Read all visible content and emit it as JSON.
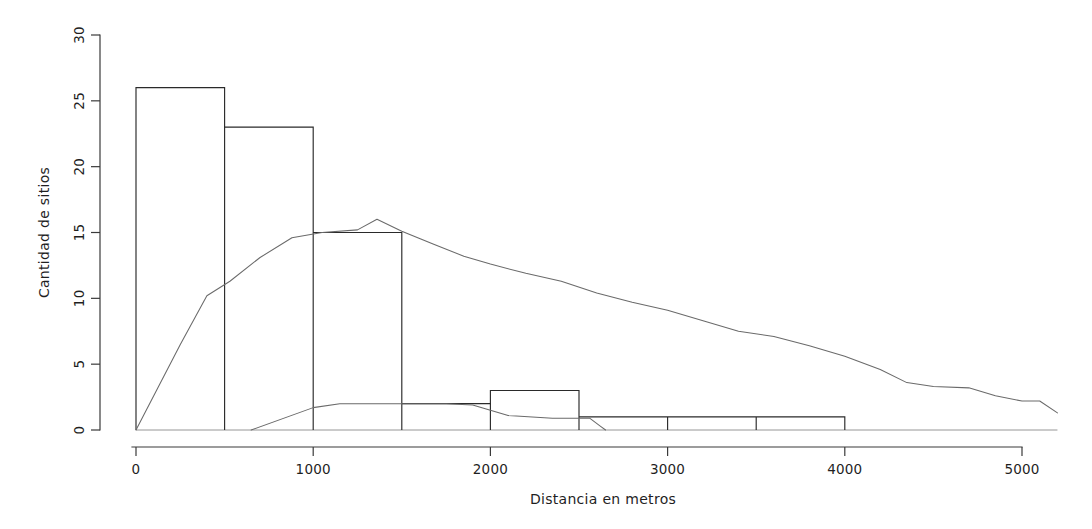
{
  "chart_data": {
    "type": "bar",
    "title": "",
    "subtitle": "",
    "xlabel": "Distancia en metros",
    "ylabel": "Cantidad de sitios",
    "xlim": [
      0,
      5200
    ],
    "ylim": [
      0,
      30
    ],
    "grid": false,
    "legend": "none",
    "xticks": [
      0,
      1000,
      2000,
      3000,
      4000,
      5000
    ],
    "xtick_labels": [
      "0",
      "1000",
      "2000",
      "3000",
      "4000",
      "5000"
    ],
    "yticks": [
      0,
      5,
      10,
      15,
      20,
      25,
      30
    ],
    "ytick_labels": [
      "0",
      "5",
      "10",
      "15",
      "20",
      "25",
      "30"
    ],
    "bin_width": 500,
    "bin_edges": [
      0,
      500,
      1000,
      1500,
      2000,
      2500,
      3000,
      3500,
      4000
    ],
    "categories": [
      "0-500",
      "500-1000",
      "1000-1500",
      "1500-2000",
      "2000-2500",
      "2500-3000",
      "3000-3500",
      "3500-4000"
    ],
    "values": [
      26,
      23,
      15,
      2,
      3,
      1,
      1,
      1
    ],
    "series": [
      {
        "name": "histograma",
        "type": "bar",
        "values": [
          26,
          23,
          15,
          2,
          3,
          1,
          1,
          1
        ]
      },
      {
        "name": "curva-principal",
        "type": "line",
        "points": [
          [
            0,
            0
          ],
          [
            250,
            6.5
          ],
          [
            400,
            10.2
          ],
          [
            530,
            11.3
          ],
          [
            700,
            13.1
          ],
          [
            880,
            14.6
          ],
          [
            1050,
            15.0
          ],
          [
            1250,
            15.2
          ],
          [
            1360,
            16.0
          ],
          [
            1500,
            15.1
          ],
          [
            1680,
            14.1
          ],
          [
            1850,
            13.2
          ],
          [
            2000,
            12.6
          ],
          [
            2200,
            11.9
          ],
          [
            2400,
            11.3
          ],
          [
            2600,
            10.4
          ],
          [
            2800,
            9.7
          ],
          [
            3000,
            9.1
          ],
          [
            3200,
            8.3
          ],
          [
            3400,
            7.5
          ],
          [
            3600,
            7.1
          ],
          [
            3800,
            6.4
          ],
          [
            4000,
            5.6
          ],
          [
            4200,
            4.6
          ],
          [
            4350,
            3.6
          ],
          [
            4500,
            3.3
          ],
          [
            4700,
            3.2
          ],
          [
            4850,
            2.6
          ],
          [
            5000,
            2.2
          ],
          [
            5100,
            2.2
          ],
          [
            5200,
            1.3
          ]
        ]
      },
      {
        "name": "curva-secundaria",
        "type": "line",
        "points": [
          [
            650,
            0
          ],
          [
            1000,
            1.7
          ],
          [
            1150,
            2.0
          ],
          [
            1750,
            2.0
          ],
          [
            1900,
            1.9
          ],
          [
            2100,
            1.1
          ],
          [
            2350,
            0.9
          ],
          [
            2560,
            0.9
          ],
          [
            2620,
            0.3
          ],
          [
            2650,
            0.0
          ]
        ]
      }
    ],
    "colors": {
      "bar_stroke": "#2a2a2a",
      "bar_fill": "none",
      "curve": "#6a6a6a",
      "axis": "#3a3a3a",
      "text": "#1f1f1f",
      "background": "#ffffff"
    }
  }
}
